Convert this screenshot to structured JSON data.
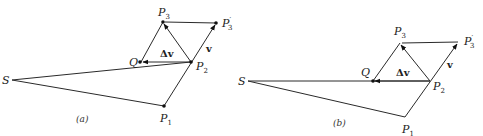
{
  "figures": [
    {
      "id": "a",
      "caption": "(a)",
      "points": {
        "S": {
          "label": "S",
          "x": 12,
          "y": 80
        },
        "P1": {
          "label": "P",
          "sub": "1",
          "x": 164,
          "y": 106
        },
        "P2": {
          "label": "P",
          "sub": "2",
          "x": 191,
          "y": 62
        },
        "P3": {
          "label": "P",
          "sub": "3",
          "x": 163,
          "y": 22
        },
        "P3p": {
          "label": "P",
          "sub": "3",
          "prime": "′",
          "x": 216,
          "y": 23
        },
        "Q": {
          "label": "Q",
          "x": 141,
          "y": 62
        }
      },
      "vector_labels": {
        "dv": "Δv",
        "v": "v"
      }
    },
    {
      "id": "b",
      "caption": "(b)",
      "points": {
        "S": {
          "label": "S",
          "x": 248,
          "y": 81
        },
        "P1": {
          "label": "P",
          "sub": "1",
          "x": 405,
          "y": 117
        },
        "P2": {
          "label": "P",
          "sub": "2",
          "x": 430,
          "y": 81
        },
        "P3": {
          "label": "P",
          "sub": "3",
          "x": 400,
          "y": 43
        },
        "P3p": {
          "label": "P",
          "sub": "3",
          "prime": "′",
          "x": 458,
          "y": 42
        },
        "Q": {
          "label": "Q",
          "x": 373,
          "y": 81
        }
      },
      "vector_labels": {
        "dv": "Δv",
        "v": "v"
      }
    }
  ]
}
